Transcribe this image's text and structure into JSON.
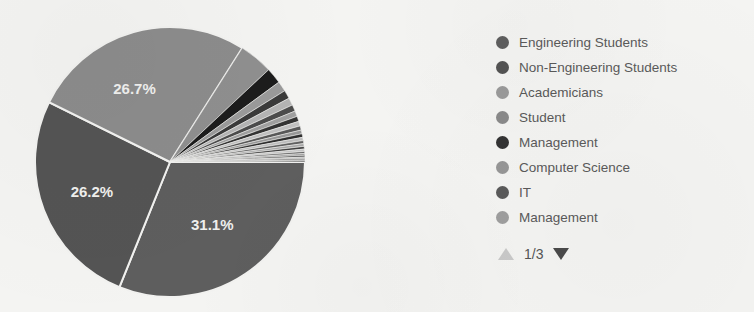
{
  "chart_data": {
    "type": "pie",
    "title": "",
    "legend_position": "right",
    "labels": [
      "Engineering Students",
      "Non-Engineering Students",
      "Academicians",
      "Student",
      "Management",
      "Computer Science",
      "IT",
      "Management"
    ],
    "visible_slice_labels": [
      "31.1%",
      "26.2%",
      "26.7%"
    ],
    "major_slices": [
      {
        "label": "31.1%",
        "value": 31.1,
        "color": "#5e5e5e",
        "start_angle": 90,
        "end_angle": 202
      },
      {
        "label": "26.2%",
        "value": 26.2,
        "color": "#545454",
        "start_angle": 202,
        "end_angle": 296.3
      },
      {
        "label": "26.7%",
        "value": 26.7,
        "color": "#8c8c8c",
        "start_angle": 296.3,
        "end_angle": 32.4
      }
    ],
    "sliver_slices": [
      {
        "value": 3.6,
        "color": "#8f8f8f"
      },
      {
        "value": 1.7,
        "color": "#1c1c1c"
      },
      {
        "value": 1.1,
        "color": "#9a9a9a"
      },
      {
        "value": 0.9,
        "color": "#3a3a3a"
      },
      {
        "value": 0.8,
        "color": "#b4b4b4"
      },
      {
        "value": 0.7,
        "color": "#4c4c4c"
      },
      {
        "value": 0.6,
        "color": "#a0a0a0"
      },
      {
        "value": 0.55,
        "color": "#333333"
      },
      {
        "value": 0.5,
        "color": "#c0c0c0"
      },
      {
        "value": 0.45,
        "color": "#585858"
      },
      {
        "value": 0.4,
        "color": "#989898"
      },
      {
        "value": 0.38,
        "color": "#2e2e2e"
      },
      {
        "value": 0.35,
        "color": "#bdbdbd"
      },
      {
        "value": 0.32,
        "color": "#606060"
      },
      {
        "value": 0.3,
        "color": "#a8a8a8"
      },
      {
        "value": 0.28,
        "color": "#3f3f3f"
      },
      {
        "value": 0.25,
        "color": "#c6c6c6"
      },
      {
        "value": 0.22,
        "color": "#6a6a6a"
      },
      {
        "value": 0.2,
        "color": "#9d9d9d"
      },
      {
        "value": 0.18,
        "color": "#464646"
      },
      {
        "value": 0.16,
        "color": "#b8b8b8"
      },
      {
        "value": 0.14,
        "color": "#555555"
      },
      {
        "value": 0.12,
        "color": "#8a8a8a"
      },
      {
        "value": 0.1,
        "color": "#2a2a2a"
      }
    ],
    "colors": {
      "background": "#f4f4f2",
      "slice_border": "#f2f2f0",
      "label_text": "#f0f0ee",
      "legend_text": "#5a5a5a"
    }
  },
  "legend": {
    "items": [
      {
        "label": "Engineering Students",
        "color": "#5e5e5e"
      },
      {
        "label": "Non-Engineering Students",
        "color": "#535353"
      },
      {
        "label": "Academicians",
        "color": "#9a9a9a"
      },
      {
        "label": "Student",
        "color": "#8a8a8a"
      },
      {
        "label": "Management",
        "color": "#333333"
      },
      {
        "label": "Computer Science",
        "color": "#969696"
      },
      {
        "label": "IT",
        "color": "#5a5a5a"
      },
      {
        "label": "Management",
        "color": "#9e9e9e"
      }
    ],
    "pager": {
      "count": "1/3",
      "up_icon": "triangle-up-icon",
      "down_icon": "triangle-down-icon"
    }
  }
}
